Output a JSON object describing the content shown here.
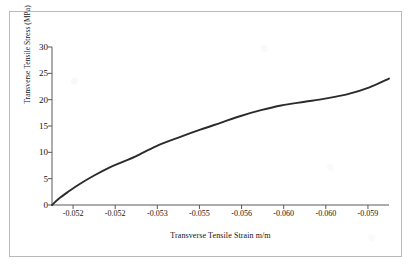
{
  "chart_data": {
    "type": "line",
    "title": "",
    "xlabel": "Transverse Tensile Strain m/m",
    "ylabel": "Transverse Tensile Stress (MPa)",
    "xtick_labels": [
      "-0.052",
      "-0.052",
      "-0.053",
      "-0.055",
      "-0.056",
      "-0.060",
      "-0.060",
      "-0.059"
    ],
    "ytick_labels": [
      "0",
      "5",
      "10",
      "15",
      "20",
      "25",
      "30"
    ],
    "ylim": [
      0,
      30
    ],
    "yticks": [
      0,
      5,
      10,
      15,
      20,
      25,
      30
    ],
    "grid": false,
    "legend": "none",
    "series": [
      {
        "name": "Transverse tensile stress-strain curve",
        "color": "#2b2b2b",
        "x_fraction": [
          0.0,
          0.02,
          0.05,
          0.08,
          0.125,
          0.17,
          0.21,
          0.25,
          0.31,
          0.375,
          0.44,
          0.5,
          0.56,
          0.62,
          0.68,
          0.75,
          0.81,
          0.875,
          0.94,
          1.0
        ],
        "values": [
          0.0,
          1.2,
          2.6,
          3.9,
          5.6,
          7.1,
          8.2,
          9.3,
          11.2,
          12.8,
          14.3,
          15.6,
          16.9,
          18.0,
          18.9,
          19.6,
          20.2,
          21.0,
          22.3,
          24.0
        ]
      }
    ]
  },
  "axis": {
    "line_color": "#5a5a5a",
    "text_color": "#111111"
  },
  "frame": {
    "border_color": "#b9b9b9"
  }
}
